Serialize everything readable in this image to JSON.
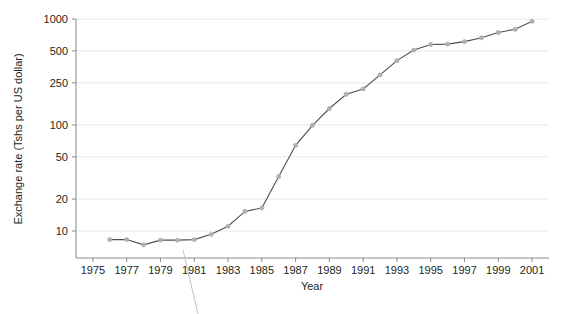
{
  "chart_data": {
    "type": "line",
    "title": "",
    "xlabel": "Year",
    "ylabel": "Exchange rate (Tshs per US dollar)",
    "yscale": "log",
    "ylim": [
      6,
      1100
    ],
    "xlim": [
      1974,
      2002
    ],
    "grid": true,
    "legend": "none",
    "y_ticks": [
      10,
      20,
      50,
      100,
      250,
      500,
      1000
    ],
    "y_tick_labels": [
      "10",
      "20",
      "50",
      "100",
      "250",
      "500",
      "1000"
    ],
    "x_ticks": [
      1975,
      1977,
      1979,
      1981,
      1983,
      1985,
      1987,
      1989,
      1991,
      1993,
      1995,
      1997,
      1999,
      2001
    ],
    "x_tick_labels": [
      "1975",
      "1977",
      "1979",
      "1981",
      "1983",
      "1985",
      "1987",
      "1989",
      "1991",
      "1993",
      "1995",
      "1997",
      "1999",
      "2001"
    ],
    "series": [
      {
        "name": "Exchange rate",
        "line_color": "#4d4d4d",
        "marker_color": "#b0b0b0",
        "x": [
          1976,
          1977,
          1978,
          1979,
          1980,
          1981,
          1982,
          1983,
          1984,
          1985,
          1986,
          1987,
          1988,
          1989,
          1990,
          1991,
          1992,
          1993,
          1994,
          1995,
          1996,
          1997,
          1998,
          1999,
          2000,
          2001
        ],
        "values": [
          8.3,
          8.3,
          7.4,
          8.2,
          8.2,
          8.3,
          9.3,
          11.1,
          15.3,
          16.5,
          32.7,
          64.3,
          99.3,
          143,
          195,
          219,
          297,
          405,
          509,
          575,
          580,
          612,
          665,
          745,
          800,
          950
        ]
      }
    ],
    "annotation": {
      "leader_line": true,
      "anchor_year": 1981
    }
  }
}
